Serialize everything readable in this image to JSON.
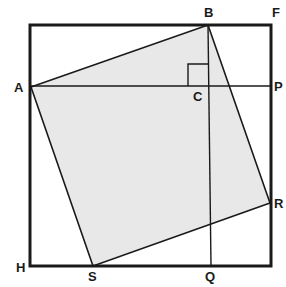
{
  "diagram": {
    "colors": {
      "stroke": "#1a1a1a",
      "fill_inner_square": "#e8e8e8",
      "background": "#ffffff"
    },
    "outer_square": {
      "x1": 30,
      "y1": 25,
      "x2": 271,
      "y2": 266
    },
    "points": {
      "A": {
        "label": "A",
        "x": 31,
        "y": 87,
        "lx": 14,
        "ly": 92
      },
      "B": {
        "label": "B",
        "x": 208,
        "y": 25,
        "lx": 204,
        "ly": 17
      },
      "F": {
        "label": "F",
        "x": 271,
        "y": 25,
        "lx": 272,
        "ly": 17
      },
      "C": {
        "label": "C",
        "x": 210,
        "y": 86,
        "lx": 193,
        "ly": 101
      },
      "P": {
        "label": "P",
        "x": 271,
        "y": 86,
        "lx": 274,
        "ly": 91
      },
      "R": {
        "label": "R",
        "x": 270,
        "y": 203,
        "lx": 274,
        "ly": 208
      },
      "Q": {
        "label": "Q",
        "x": 211,
        "y": 266,
        "lx": 205,
        "ly": 281
      },
      "S": {
        "label": "S",
        "x": 93,
        "y": 266,
        "lx": 88,
        "ly": 281
      },
      "H": {
        "label": "H",
        "x": 30,
        "y": 266,
        "lx": 16,
        "ly": 272
      }
    },
    "labels": [
      "A",
      "B",
      "F",
      "C",
      "P",
      "R",
      "Q",
      "S",
      "H"
    ]
  }
}
